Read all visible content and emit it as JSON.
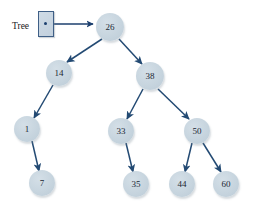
{
  "diagram": {
    "background_color": "#ffffff",
    "node_fill_color": "#c6d4de",
    "node_text_color": "#1a2733",
    "edge_color": "#234a73",
    "pointer_box_border_color": "#3f5f86",
    "pointer_box_fill_color": "#c8d6e2"
  },
  "pointer": {
    "label": "Tree",
    "label_x": 12,
    "label_y": 21,
    "box": {
      "x": 38,
      "y": 11,
      "w": 16,
      "h": 26
    },
    "dot": {
      "x": 44,
      "y": 22
    },
    "arrow": {
      "x1": 47,
      "y1": 24,
      "x2": 93,
      "y2": 24
    }
  },
  "nodes": [
    {
      "id": "n26",
      "label": "26",
      "cx": 110,
      "cy": 27,
      "r": 14
    },
    {
      "id": "n14",
      "label": "14",
      "cx": 59,
      "cy": 73,
      "r": 13
    },
    {
      "id": "n38",
      "label": "38",
      "cx": 150,
      "cy": 76,
      "r": 14
    },
    {
      "id": "n1",
      "label": "1",
      "cx": 27,
      "cy": 129,
      "r": 13
    },
    {
      "id": "n33",
      "label": "33",
      "cx": 121,
      "cy": 131,
      "r": 13
    },
    {
      "id": "n50",
      "label": "50",
      "cx": 197,
      "cy": 131,
      "r": 13
    },
    {
      "id": "n7",
      "label": "7",
      "cx": 42,
      "cy": 183,
      "r": 13
    },
    {
      "id": "n35",
      "label": "35",
      "cx": 136,
      "cy": 184,
      "r": 13
    },
    {
      "id": "n44",
      "label": "44",
      "cx": 182,
      "cy": 184,
      "r": 13
    },
    {
      "id": "n60",
      "label": "60",
      "cx": 226,
      "cy": 184,
      "r": 13
    }
  ],
  "edges": [
    {
      "from": "n26",
      "to": "n14",
      "x1": 102,
      "y1": 39,
      "x2": 67,
      "y2": 62
    },
    {
      "from": "n26",
      "to": "n38",
      "x1": 119,
      "y1": 39,
      "x2": 142,
      "y2": 64
    },
    {
      "from": "n14",
      "to": "n1",
      "x1": 53,
      "y1": 85,
      "x2": 34,
      "y2": 118
    },
    {
      "from": "n38",
      "to": "n33",
      "x1": 143,
      "y1": 89,
      "x2": 127,
      "y2": 119
    },
    {
      "from": "n38",
      "to": "n50",
      "x1": 158,
      "y1": 89,
      "x2": 189,
      "y2": 119
    },
    {
      "from": "n1",
      "to": "n7",
      "x1": 32,
      "y1": 141,
      "x2": 39,
      "y2": 171
    },
    {
      "from": "n33",
      "to": "n35",
      "x1": 126,
      "y1": 143,
      "x2": 133,
      "y2": 172
    },
    {
      "from": "n50",
      "to": "n44",
      "x1": 192,
      "y1": 143,
      "x2": 185,
      "y2": 172
    },
    {
      "from": "n50",
      "to": "n60",
      "x1": 203,
      "y1": 143,
      "x2": 221,
      "y2": 172
    }
  ]
}
